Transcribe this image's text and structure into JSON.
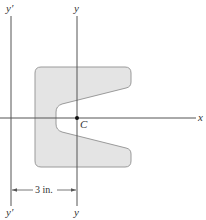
{
  "diagram": {
    "type": "cross-section area with centroidal and parallel axes",
    "axes": {
      "y_prime_top_label": "y′",
      "y_prime_bottom_label": "y′",
      "y_top_label": "y",
      "y_bottom_label": "y",
      "x_label": "x"
    },
    "centroid_label": "C",
    "dimension": {
      "label": "3 in.",
      "between": [
        "y′",
        "y"
      ]
    },
    "colors": {
      "shape_fill": "#e4e4e4",
      "shape_stroke": "#9a9a9a",
      "axis_line": "#555555",
      "text": "#333333",
      "centroid_dot": "#111111"
    }
  }
}
